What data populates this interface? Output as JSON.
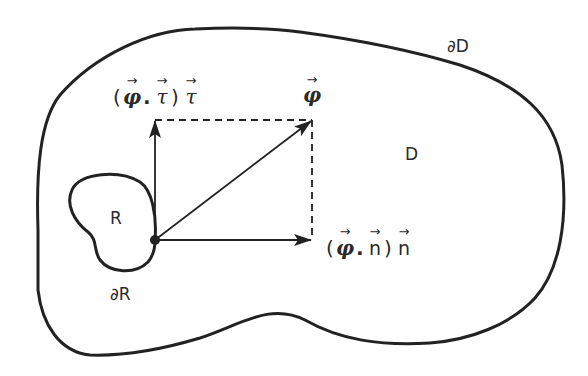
{
  "diagram": {
    "type": "vector-decomposition-on-boundary",
    "colors": {
      "stroke": "#222222",
      "background": "#ffffff"
    },
    "regions": {
      "outer_region": {
        "label": "D",
        "boundary_label": "∂D"
      },
      "inner_region": {
        "label": "R",
        "boundary_label": "∂R"
      }
    },
    "vectors": {
      "phi": {
        "symbol": "φ",
        "arrow": "→"
      },
      "tangential": {
        "open": "(",
        "a": "φ",
        "dot": ".",
        "b": "τ",
        "close": ")",
        "c": "τ",
        "arrow": "→"
      },
      "normal": {
        "open": "(",
        "a": "φ",
        "dot": ".",
        "b": "n",
        "close": ")",
        "c": "n",
        "arrow": "→"
      }
    }
  }
}
